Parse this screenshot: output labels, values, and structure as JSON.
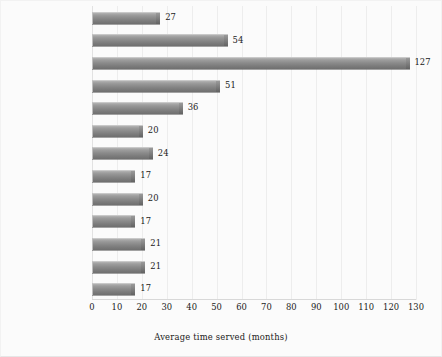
{
  "chart_data": {
    "type": "bar",
    "orientation": "horizontal",
    "title": "",
    "xlabel": "Average time served (months)",
    "ylabel": "",
    "xlim": [
      0,
      130
    ],
    "xticks": [
      0,
      10,
      20,
      30,
      40,
      50,
      60,
      70,
      80,
      90,
      100,
      110,
      120,
      130
    ],
    "grid": "vertical",
    "legend": "none",
    "categories": [
      "All offenses",
      "Violent offenses",
      "Murder",
      "Robbery",
      "Assault",
      "Property offenses",
      "Burglary",
      "Larceny",
      "Drug offenses",
      "Possession",
      "Trafficking",
      "Weapons offenses",
      "Other offenses"
    ],
    "values": [
      27,
      54,
      127,
      51,
      36,
      20,
      24,
      17,
      20,
      17,
      21,
      21,
      17
    ],
    "emphasis": [
      true,
      true,
      false,
      false,
      false,
      true,
      false,
      false,
      true,
      false,
      false,
      true,
      true
    ],
    "data_labels": [
      "27",
      "54",
      "127",
      "51",
      "36",
      "20",
      "24",
      "17",
      "20",
      "17",
      "21",
      "21",
      "17"
    ],
    "colors": {
      "bar_light": "#b3b3b3",
      "bar_dark": "#6f6f6f",
      "gridline": "#ededed",
      "axis": "#d8d8d8",
      "text": "#1a1a1a",
      "background": "#fbfbfb"
    }
  }
}
